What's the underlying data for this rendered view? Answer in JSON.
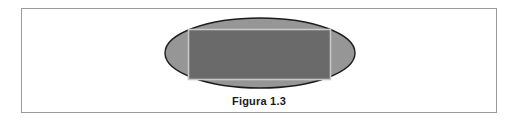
{
  "figure": {
    "caption": "Figura 1.3",
    "frame": {
      "border_color": "#9a9a9a",
      "background": "#ffffff"
    },
    "shapes": {
      "ellipse": {
        "name": "ellipse",
        "fill": "#969696",
        "stroke": "#1c1c1c",
        "cx": 260,
        "cy": 53,
        "rx": 95,
        "ry": 35
      },
      "rectangle": {
        "name": "rectangle",
        "fill": "#6a6a6a",
        "stroke": "#c8c8c8",
        "x": 188,
        "y": 29,
        "width": 142,
        "height": 50
      }
    }
  },
  "chart_data": {
    "type": "diagram",
    "title": "Figura 1.3",
    "elements": [
      {
        "shape": "ellipse",
        "fill": "#969696",
        "stroke": "#1c1c1c",
        "center": [
          260,
          53
        ],
        "radii": [
          95,
          35
        ]
      },
      {
        "shape": "rectangle",
        "fill": "#6a6a6a",
        "stroke": "#c8c8c8",
        "origin": [
          188,
          29
        ],
        "size": [
          142,
          50
        ]
      }
    ]
  }
}
